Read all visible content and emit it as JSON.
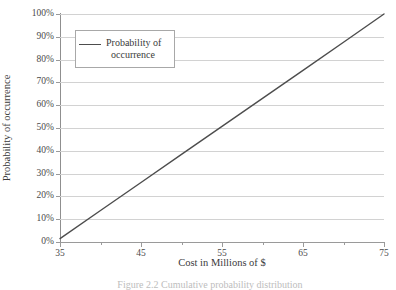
{
  "figure": {
    "caption": "Figure 2.2  Cumulative probability distribution"
  },
  "legend": {
    "entry_line1": "Probability of",
    "entry_line2": "occurrence",
    "border_color": "#a8a8a8"
  },
  "axes": {
    "x_title": "Cost in Millions of $",
    "y_title": "Probability of occurrence"
  },
  "chart_data": {
    "type": "line",
    "title": "",
    "xlabel": "Cost in Millions of $",
    "ylabel": "Probability of occurrence",
    "xlim": [
      35,
      75
    ],
    "ylim": [
      0,
      100
    ],
    "xticks": [
      35,
      45,
      55,
      65,
      75
    ],
    "xtick_labels": [
      "35",
      "45",
      "55",
      "65",
      "75"
    ],
    "x_minor_tick_step": 5,
    "yticks": [
      0,
      10,
      20,
      30,
      40,
      50,
      60,
      70,
      80,
      90,
      100
    ],
    "ytick_labels": [
      "0%",
      "10%",
      "20%",
      "30%",
      "40%",
      "50%",
      "60%",
      "70%",
      "80%",
      "90%",
      "100%"
    ],
    "grid": "horizontal",
    "legend_position": "upper left",
    "line_color": "#4d4d4d",
    "grid_color": "#d2d2d2",
    "axis_color": "#8f8f8f",
    "series": [
      {
        "name": "Probability of occurrence",
        "x": [
          35,
          40,
          45,
          50,
          55,
          60,
          65,
          70,
          75
        ],
        "values": [
          1.5,
          13.8,
          26.1,
          38.4,
          50.7,
          63.0,
          75.3,
          87.6,
          100.0
        ]
      }
    ]
  }
}
